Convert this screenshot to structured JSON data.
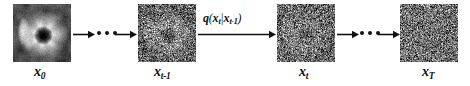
{
  "figure": {
    "background_color": "#ffffff",
    "ink_color": "#121212",
    "width": 470,
    "height": 86
  },
  "steps": [
    {
      "id": "x0",
      "label_base": "x",
      "label_sub": "0",
      "label_full": "x0",
      "description": "original clean image of a flower with bright petals and a dark center",
      "noise_level": 0.0
    },
    {
      "id": "xt1",
      "label_base": "x",
      "label_sub": "t-1",
      "label_full": "xt-1",
      "description": "noisy image, underlying flower structure still visible",
      "noise_level": 0.55
    },
    {
      "id": "xt",
      "label_base": "x",
      "label_sub": "t",
      "label_full": "xt",
      "description": "heavily noised image, faint structure remaining",
      "noise_level": 0.78
    },
    {
      "id": "xT",
      "label_base": "x",
      "label_sub": "T",
      "label_full": "xT",
      "description": "pure gaussian noise, no structure",
      "noise_level": 1.0
    }
  ],
  "transition": {
    "function_name": "q",
    "open_paren": "(",
    "target_base": "x",
    "target_sub": "t",
    "given_bar": "|",
    "source_base": "x",
    "source_sub": "t-1",
    "close_paren": ")",
    "label_full": "q(xt|xt-1)"
  },
  "ellipses": {
    "dot_count": 3,
    "left_meaning": "intermediate diffusion steps between x0 and xt-1",
    "right_meaning": "intermediate diffusion steps between xt and xT"
  },
  "icons": {
    "arrow": "arrow-right-icon",
    "ellipsis": "ellipsis-horizontal-icon"
  }
}
